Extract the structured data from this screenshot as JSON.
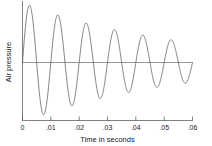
{
  "chart_data": {
    "type": "line",
    "title": "",
    "xlabel": "Time in seconds",
    "ylabel": "Air pressure",
    "xlim": [
      0,
      0.06
    ],
    "ylim": [
      -1.05,
      1.05
    ],
    "grid": false,
    "legend": null,
    "xticklabels": [
      "0",
      ".01",
      ".02",
      ".03",
      ".04",
      ".05",
      ".06"
    ],
    "xtickvalues": [
      0,
      0.01,
      0.02,
      0.03,
      0.04,
      0.05,
      0.06
    ],
    "yticklabels": [],
    "series": [
      {
        "name": "Air pressure",
        "form": "damped-sine",
        "amplitude": 1.0,
        "frequency_hz": 100,
        "decay_constant_per_s": 18.5,
        "phase": 0,
        "color": "#5b5b5b",
        "peaks": [
          {
            "x": 0.0025,
            "y": 0.95
          },
          {
            "x": 0.0125,
            "y": 0.8
          },
          {
            "x": 0.0225,
            "y": 0.66
          },
          {
            "x": 0.0325,
            "y": 0.55
          },
          {
            "x": 0.0425,
            "y": 0.46
          },
          {
            "x": 0.0525,
            "y": 0.38
          }
        ],
        "troughs": [
          {
            "x": 0.0075,
            "y": -0.87
          },
          {
            "x": 0.0175,
            "y": -0.73
          },
          {
            "x": 0.0275,
            "y": -0.6
          },
          {
            "x": 0.0375,
            "y": -0.5
          },
          {
            "x": 0.0475,
            "y": -0.42
          },
          {
            "x": 0.0575,
            "y": -0.35
          }
        ]
      }
    ]
  },
  "axes": {
    "zero_line_label": "zero pressure baseline"
  }
}
